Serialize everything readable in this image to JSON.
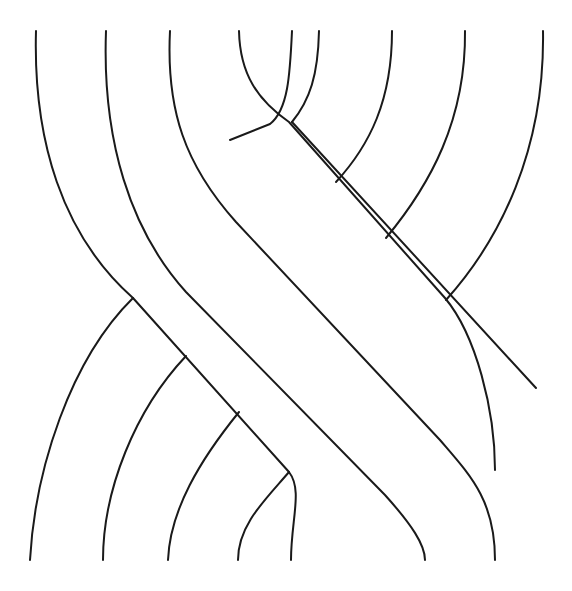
{
  "diagram": {
    "type": "braid",
    "stroke_color": "#1a1a1a",
    "background_color": "#ffffff",
    "strands": [
      {
        "name": "strand-1",
        "d": "M36 31 C 34 130, 60 230, 133 298"
      },
      {
        "name": "strand-2",
        "d": "M106 31 C 102 130, 130 230, 184 286 L 442 543 C 450 552, 452 556, 453 560"
      },
      {
        "name": "strand-3",
        "d": "M170 31 C 165 110, 190 160, 240 213 L 520 492"
      },
      {
        "name": "strand-4",
        "d": "M239 31 C 240 90, 265 115, 289 122 L 318 177"
      },
      {
        "name": "strand-5",
        "d": "M292 31 C 290 70, 285 110, 269 126"
      },
      {
        "name": "strand-6",
        "d": "M358 31 C 360 110, 340 150, 334 180"
      },
      {
        "name": "strand-7",
        "d": "M425 31 C 425 120, 410 180, 384 236"
      },
      {
        "name": "strand-8",
        "d": "M495 31 C 498 140, 470 240, 445 298"
      },
      {
        "name": "left-ribbon-edge-a",
        "d": "M133 298 C 75 350, 30 470, 30 560"
      },
      {
        "name": "left-ribbon-edge-b",
        "d": "M184 356 C 135 410, 103 490, 103 560"
      },
      {
        "name": "left-ribbon-edge-c",
        "d": "M239 412 C 195 460, 168 510, 168 560"
      },
      {
        "name": "left-ribbon-edge-d",
        "d": "M289 472 C 265 500, 238 520, 238 560"
      },
      {
        "name": "diagonal-upper",
        "d": "M133 298 L 289 472 C 300 490, 291 530, 291 560"
      },
      {
        "name": "diagonal-lower",
        "d": "M289 122 L 445 298 C 475 340, 495 420, 495 560"
      },
      {
        "name": "middle-diag-a",
        "d": "M184 286 L 380 492 C 400 520, 425 540, 425 560"
      },
      {
        "name": "middle-diag-b",
        "d": "M240 213 L 359 350 C 380 380, 359 460, 359 560"
      }
    ]
  }
}
